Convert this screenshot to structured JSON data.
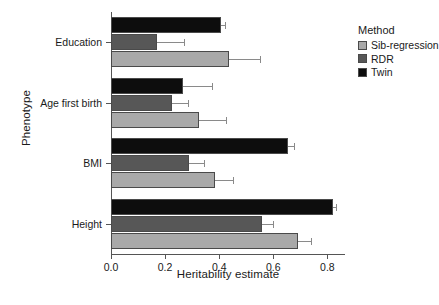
{
  "chart_data": {
    "type": "bar",
    "orientation": "horizontal",
    "title": "",
    "xlabel": "Heritability estimate",
    "ylabel": "Phenotype",
    "xlim": [
      0.0,
      0.865
    ],
    "xticks": [
      0.0,
      0.2,
      0.4,
      0.6,
      0.8
    ],
    "xticklabels": [
      "0.0",
      "0.2",
      "0.4",
      "0.6",
      "0.8"
    ],
    "categories": [
      "Education",
      "Age first birth",
      "BMI",
      "Height"
    ],
    "grid": false,
    "legend_position": "right",
    "legend_title": "Method",
    "series": [
      {
        "name": "Sib-regression",
        "color": "#a9a9a9",
        "values": [
          0.435,
          0.325,
          0.385,
          0.69
        ],
        "err_high": [
          0.55,
          0.425,
          0.45,
          0.74
        ]
      },
      {
        "name": "RDR",
        "color": "#575757",
        "values": [
          0.17,
          0.225,
          0.29,
          0.56
        ],
        "err_high": [
          0.27,
          0.285,
          0.345,
          0.6
        ]
      },
      {
        "name": "Twin",
        "color": "#0d0d0d",
        "values": [
          0.405,
          0.265,
          0.655,
          0.82
        ],
        "err_high": [
          0.42,
          0.375,
          0.675,
          0.83
        ]
      }
    ]
  },
  "legend": {
    "title": "Method",
    "items": [
      {
        "label": "Sib-regression",
        "color": "#a9a9a9"
      },
      {
        "label": "RDR",
        "color": "#575757"
      },
      {
        "label": "Twin",
        "color": "#0d0d0d"
      }
    ]
  },
  "axes": {
    "x_title": "Heritability estimate",
    "y_title": "Phenotype",
    "x_tick_labels": [
      "0.0",
      "0.2",
      "0.4",
      "0.6",
      "0.8"
    ],
    "y_tick_labels": [
      "Education",
      "Age first birth",
      "BMI",
      "Height"
    ]
  }
}
